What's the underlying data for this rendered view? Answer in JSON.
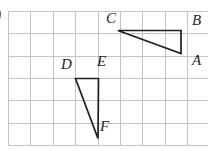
{
  "figure": {
    "colors": {
      "background": "#ffffff",
      "grid_line": "#c3c3c3",
      "triangle_stroke": "#1e1e1e"
    },
    "grid": {
      "columns": 9,
      "rows": 6,
      "cell_size_px": 22.4
    }
  },
  "triangles": [
    {
      "name": "ABC",
      "points": "118,30.5 181,30.5 181,53.5",
      "vertices": [
        {
          "label": "C",
          "x": 118,
          "y": 30.5
        },
        {
          "label": "B",
          "x": 181,
          "y": 30.5
        },
        {
          "label": "A",
          "x": 181,
          "y": 53.5
        }
      ]
    },
    {
      "name": "DEF",
      "points": "75.5,78.5 98.5,78.5 98,138.5",
      "vertices": [
        {
          "label": "D",
          "x": 75.5,
          "y": 78.5
        },
        {
          "label": "E",
          "x": 98.5,
          "y": 78.5
        },
        {
          "label": "F",
          "x": 98,
          "y": 138.5
        }
      ]
    }
  ],
  "labels": [
    {
      "text": "C"
    },
    {
      "text": "B"
    },
    {
      "text": "A"
    },
    {
      "text": "D"
    },
    {
      "text": "E"
    },
    {
      "text": "F"
    }
  ],
  "edge_mark": {
    "text": ")"
  }
}
